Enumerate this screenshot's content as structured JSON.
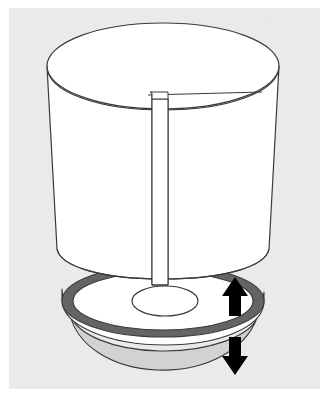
{
  "figure": {
    "style": "black and white technical line drawing",
    "faint_mark_label": "h",
    "canvas": {
      "width": 328,
      "height": 396
    },
    "colors": {
      "page_background": "#ffffff",
      "plate_background": "#eaeaea",
      "line": "#3a3a3a",
      "fill_white": "#ffffff",
      "ring_dark_gray": "#646464",
      "bowl_light_gray": "#d2d2d2",
      "arrow_black": "#000000"
    },
    "plate": {
      "x": 9,
      "y": 8,
      "width": 311,
      "height": 381
    }
  },
  "parts": [
    {
      "id": "cylinder",
      "label": "Cylindrical vessel",
      "description": "Open-top cylinder drawn in perspective with elliptical rim",
      "fill": "#ffffff",
      "stroke": "#3a3a3a"
    },
    {
      "id": "cylinder-top-rim",
      "label": "Cylinder top rim ellipse",
      "fill": "#ffffff",
      "stroke": "#3a3a3a"
    },
    {
      "id": "inner-panel",
      "label": "Inner vertical partition panel",
      "description": "Flat vertical strip inside cylinder extending below the cylinder base",
      "fill": "#ffffff",
      "stroke": "#3a3a3a"
    },
    {
      "id": "panel-notch",
      "label": "Notch step at panel top",
      "description": "Small rectangular step where partition meets the rim"
    },
    {
      "id": "disc-ring",
      "label": "Dark annular ring of base disc",
      "fill": "#646464",
      "stroke": "#3a3a3a"
    },
    {
      "id": "disc-top",
      "label": "Base disc top face",
      "fill": "#ffffff",
      "stroke": "#3a3a3a"
    },
    {
      "id": "disc-hole",
      "label": "Central aperture in base disc",
      "fill": "#ffffff",
      "stroke": "#3a3a3a"
    },
    {
      "id": "disc-rim-edge",
      "label": "Base disc outer rim thickness",
      "fill": "#ffffff",
      "stroke": "#3a3a3a"
    },
    {
      "id": "bowl",
      "label": "Tapered bowl underside",
      "fill": "#d2d2d2",
      "stroke": "#3a3a3a"
    }
  ],
  "annotations": {
    "arrows": [
      {
        "id": "arrow-up",
        "label": "Upward motion arrow",
        "direction": "up",
        "color": "#000000",
        "x": 224,
        "y": 278,
        "width": 22,
        "height": 38
      },
      {
        "id": "arrow-down",
        "label": "Downward motion arrow",
        "direction": "down",
        "color": "#000000",
        "x": 224,
        "y": 338,
        "width": 22,
        "height": 38
      }
    ]
  }
}
